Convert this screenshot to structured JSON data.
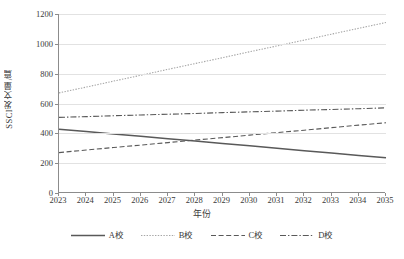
{
  "chart_data": {
    "type": "line",
    "title": "",
    "xlabel": "年份",
    "ylabel": "SSCI发文量/篇",
    "grid": true,
    "legend_position": "bottom",
    "categories": [
      "2023",
      "2024",
      "2025",
      "2026",
      "2027",
      "2028",
      "2029",
      "2030",
      "2031",
      "2032",
      "2033",
      "2034",
      "2035"
    ],
    "x": [
      2023,
      2024,
      2025,
      2026,
      2027,
      2028,
      2029,
      2030,
      2031,
      2032,
      2033,
      2034,
      2035
    ],
    "xlim": [
      2023,
      2035
    ],
    "ylim": [
      0,
      1200
    ],
    "yticks": [
      0,
      200,
      400,
      600,
      800,
      1000,
      1200
    ],
    "series": [
      {
        "name": "A校",
        "style": "solid",
        "color": "#595959",
        "values": [
          428,
          412,
          396,
          380,
          364,
          348,
          332,
          316,
          300,
          284,
          268,
          252,
          236
        ]
      },
      {
        "name": "B校",
        "style": "dotted",
        "color": "#a6a6a6",
        "values": [
          671,
          710,
          750,
          789,
          829,
          868,
          907,
          947,
          986,
          1025,
          1065,
          1104,
          1143
        ]
      },
      {
        "name": "C校",
        "style": "dashed",
        "color": "#595959",
        "values": [
          271,
          288,
          305,
          321,
          338,
          355,
          371,
          388,
          405,
          421,
          438,
          455,
          471
        ]
      },
      {
        "name": "D校",
        "style": "dashdot",
        "color": "#595959",
        "values": [
          507,
          512,
          518,
          523,
          528,
          533,
          539,
          544,
          549,
          555,
          560,
          565,
          571
        ]
      }
    ]
  },
  "legend": {
    "items": [
      {
        "label": "A校"
      },
      {
        "label": "B校"
      },
      {
        "label": "C校"
      },
      {
        "label": "D校"
      }
    ]
  }
}
